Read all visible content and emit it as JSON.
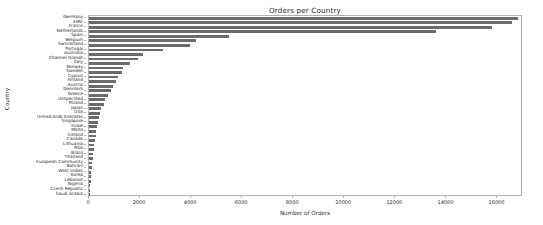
{
  "chart_data": {
    "type": "bar",
    "orientation": "horizontal",
    "title": "Orders per Country",
    "xlabel": "Number of Orders",
    "ylabel": "Country",
    "xlim": [
      0,
      17000
    ],
    "xticks": [
      0,
      2000,
      4000,
      6000,
      8000,
      10000,
      12000,
      14000,
      16000
    ],
    "xticklabels": [
      "0",
      "2000",
      "4000",
      "6000",
      "8000",
      "10000",
      "12000",
      "14000",
      "16000"
    ],
    "grid": false,
    "legend": false,
    "bar_color": "#6b6b6b",
    "categories": [
      "Germany",
      "EIRE",
      "France",
      "Netherlands",
      "Spain",
      "Belgium",
      "Switzerland",
      "Portugal",
      "Australia",
      "Channel Islands",
      "Italy",
      "Norway",
      "Sweden",
      "Cyprus",
      "Finland",
      "Austria",
      "Denmark",
      "Greece",
      "Unspecified",
      "Poland",
      "Japan",
      "USA",
      "United Arab Emirates",
      "Singapore",
      "Israel",
      "Malta",
      "Iceland",
      "Canada",
      "Lithuania",
      "RSA",
      "Brazil",
      "Thailand",
      "European Community",
      "Bahrain",
      "West Indies",
      "Korea",
      "Lebanon",
      "Nigeria",
      "Czech Republic",
      "Saudi Arabia"
    ],
    "values": [
      16800,
      16550,
      15800,
      13600,
      5500,
      4200,
      3950,
      2900,
      2100,
      1900,
      1600,
      1350,
      1280,
      1150,
      1050,
      950,
      850,
      740,
      620,
      580,
      480,
      440,
      400,
      360,
      320,
      290,
      260,
      230,
      200,
      180,
      160,
      140,
      120,
      105,
      90,
      75,
      60,
      45,
      32,
      20
    ]
  }
}
